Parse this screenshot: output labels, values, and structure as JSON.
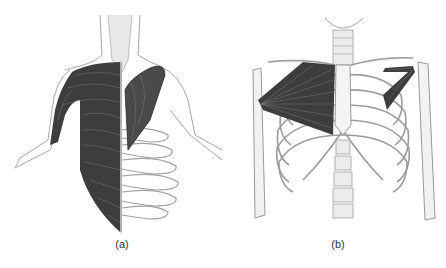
{
  "figure": {
    "panels": [
      {
        "id": "a",
        "label": "(a)",
        "description": "Back/torso view: trapezius and latissimus dorsi muscles shown on left half over skeleton on right half"
      },
      {
        "id": "b",
        "label": "(b)",
        "description": "Anterior skeleton rib cage with pectoralis major on left and pectoralis minor on right"
      }
    ],
    "colors": {
      "muscle": "#3a3a3a",
      "bone_outline": "#9a9a9a",
      "bone_fill": "#f2f2f2",
      "background": "#ffffff"
    }
  }
}
